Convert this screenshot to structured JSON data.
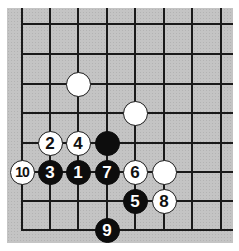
{
  "diagram": {
    "type": "go-board-fragment",
    "colors": {
      "board": "#c4c4c4",
      "line": "#1a1a1a",
      "black": "#0d0d0d",
      "white": "#ffffff"
    },
    "grid": {
      "columns_x": [
        22,
        50,
        78,
        107,
        135,
        164,
        192,
        221
      ],
      "rows_y": [
        24,
        54,
        84,
        113,
        143,
        172,
        201,
        230
      ],
      "edges": [
        "left",
        "bottom"
      ]
    },
    "stones": [
      {
        "color": "white",
        "label": "",
        "col": 2,
        "row": 2
      },
      {
        "color": "white",
        "label": "",
        "col": 4,
        "row": 3
      },
      {
        "color": "black",
        "label": "",
        "col": 3,
        "row": 4
      },
      {
        "color": "white",
        "label": "2",
        "col": 1,
        "row": 4
      },
      {
        "color": "white",
        "label": "4",
        "col": 2,
        "row": 4
      },
      {
        "color": "white",
        "label": "10",
        "col": 0,
        "row": 5
      },
      {
        "color": "black",
        "label": "3",
        "col": 1,
        "row": 5
      },
      {
        "color": "black",
        "label": "1",
        "col": 2,
        "row": 5
      },
      {
        "color": "black",
        "label": "7",
        "col": 3,
        "row": 5
      },
      {
        "color": "white",
        "label": "6",
        "col": 4,
        "row": 5
      },
      {
        "color": "white",
        "label": "",
        "col": 5,
        "row": 5
      },
      {
        "color": "black",
        "label": "5",
        "col": 4,
        "row": 6
      },
      {
        "color": "white",
        "label": "8",
        "col": 5,
        "row": 6
      },
      {
        "color": "black",
        "label": "9",
        "col": 3,
        "row": 7
      }
    ]
  }
}
